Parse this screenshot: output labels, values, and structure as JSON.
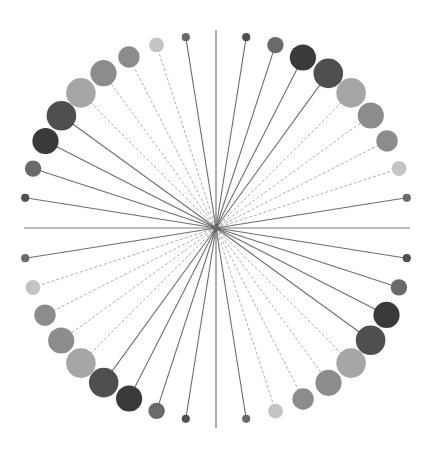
{
  "chart_data": {
    "type": "radial-lollipop",
    "title": "",
    "slot_count": 40,
    "angle_step_deg": 9,
    "axes": [
      {
        "name": "axis-up",
        "angle_deg": 0
      },
      {
        "name": "axis-right",
        "angle_deg": 90
      },
      {
        "name": "axis-down",
        "angle_deg": 180
      },
      {
        "name": "axis-left",
        "angle_deg": 270
      }
    ],
    "spokes": [
      {
        "angle_deg": 9,
        "size": 1,
        "shade": "dark"
      },
      {
        "angle_deg": 18,
        "size": 2,
        "shade": "mid-dark"
      },
      {
        "angle_deg": 27,
        "size": 3.2,
        "shade": "darkest"
      },
      {
        "angle_deg": 36,
        "size": 3.6,
        "shade": "dark"
      },
      {
        "angle_deg": 45,
        "size": 3.6,
        "shade": "light"
      },
      {
        "angle_deg": 54,
        "size": 3.2,
        "shade": "mid"
      },
      {
        "angle_deg": 63,
        "size": 2.6,
        "shade": "mid"
      },
      {
        "angle_deg": 72,
        "size": 1.8,
        "shade": "lightest"
      },
      {
        "angle_deg": 81,
        "size": 1,
        "shade": "mid-dark"
      },
      {
        "angle_deg": 99,
        "size": 1,
        "shade": "dark"
      },
      {
        "angle_deg": 108,
        "size": 2,
        "shade": "mid-dark"
      },
      {
        "angle_deg": 117,
        "size": 3.2,
        "shade": "darkest"
      },
      {
        "angle_deg": 126,
        "size": 3.6,
        "shade": "dark"
      },
      {
        "angle_deg": 135,
        "size": 3.6,
        "shade": "light"
      },
      {
        "angle_deg": 144,
        "size": 3.2,
        "shade": "mid"
      },
      {
        "angle_deg": 153,
        "size": 2.6,
        "shade": "mid"
      },
      {
        "angle_deg": 162,
        "size": 1.8,
        "shade": "lightest"
      },
      {
        "angle_deg": 171,
        "size": 1,
        "shade": "mid-dark"
      },
      {
        "angle_deg": 189,
        "size": 1,
        "shade": "dark"
      },
      {
        "angle_deg": 198,
        "size": 2,
        "shade": "mid-dark"
      },
      {
        "angle_deg": 207,
        "size": 3.2,
        "shade": "darkest"
      },
      {
        "angle_deg": 216,
        "size": 3.6,
        "shade": "dark"
      },
      {
        "angle_deg": 225,
        "size": 3.6,
        "shade": "light"
      },
      {
        "angle_deg": 234,
        "size": 3.2,
        "shade": "mid"
      },
      {
        "angle_deg": 243,
        "size": 2.6,
        "shade": "mid"
      },
      {
        "angle_deg": 252,
        "size": 1.8,
        "shade": "lightest"
      },
      {
        "angle_deg": 261,
        "size": 1,
        "shade": "mid-dark"
      },
      {
        "angle_deg": 279,
        "size": 1,
        "shade": "dark"
      },
      {
        "angle_deg": 288,
        "size": 2,
        "shade": "mid-dark"
      },
      {
        "angle_deg": 297,
        "size": 3.2,
        "shade": "darkest"
      },
      {
        "angle_deg": 306,
        "size": 3.6,
        "shade": "dark"
      },
      {
        "angle_deg": 315,
        "size": 3.6,
        "shade": "light"
      },
      {
        "angle_deg": 324,
        "size": 3.2,
        "shade": "mid"
      },
      {
        "angle_deg": 333,
        "size": 2.6,
        "shade": "mid"
      },
      {
        "angle_deg": 342,
        "size": 1.8,
        "shade": "lightest"
      },
      {
        "angle_deg": 351,
        "size": 1,
        "shade": "mid-dark"
      }
    ],
    "shades": {
      "darkest": "#3a3a3a",
      "dark": "#4f4f4f",
      "mid-dark": "#6a6a6a",
      "mid": "#8c8c8c",
      "light": "#a6a6a6",
      "lightest": "#c4c4c4"
    },
    "line_colors": {
      "axis": "#7a7a7a",
      "solid": "#6e6e6e",
      "dashed": "#b0b0b0"
    },
    "grid": false,
    "legend": "none"
  }
}
